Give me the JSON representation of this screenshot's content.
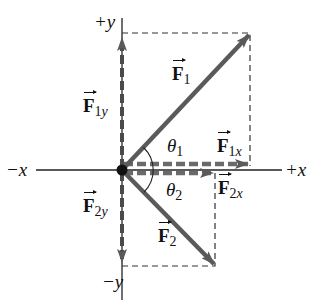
{
  "axes": {
    "pos_y": "+y",
    "neg_y": "−y",
    "pos_x": "+x",
    "neg_x": "−x"
  },
  "vectors": {
    "F1": {
      "symbol": "F",
      "sub": "1"
    },
    "F2": {
      "symbol": "F",
      "sub": "2"
    },
    "F1x": {
      "symbol": "F",
      "sub_num": "1",
      "sub_var": "x"
    },
    "F1y": {
      "symbol": "F",
      "sub_num": "1",
      "sub_var": "y"
    },
    "F2x": {
      "symbol": "F",
      "sub_num": "2",
      "sub_var": "x"
    },
    "F2y": {
      "symbol": "F",
      "sub_num": "2",
      "sub_var": "y"
    }
  },
  "angles": {
    "theta1": {
      "symbol": "θ",
      "sub": "1"
    },
    "theta2": {
      "symbol": "θ",
      "sub": "2"
    }
  },
  "colors": {
    "vector": "#5a5a5a",
    "axis": "#222222",
    "dash": "#333333"
  }
}
